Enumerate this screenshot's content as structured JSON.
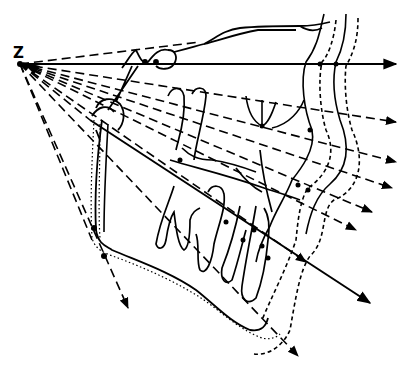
{
  "diagram": {
    "type": "cephalometric-tracing",
    "colors": {
      "ink": "#000000",
      "background": "#ffffff"
    },
    "origin_label": "Z",
    "origin_point": [
      20,
      64
    ],
    "rays": [
      {
        "id": "horizontal",
        "style": "solid",
        "end": [
          398,
          64
        ]
      },
      {
        "id": "r1",
        "style": "dashed",
        "end": [
          398,
          122
        ]
      },
      {
        "id": "r2",
        "style": "dashed",
        "end": [
          396,
          160
        ]
      },
      {
        "id": "r3",
        "style": "dashed",
        "end": [
          398,
          162
        ]
      },
      {
        "id": "r4",
        "style": "dashed",
        "end": [
          372,
          210
        ]
      },
      {
        "id": "r5",
        "style": "dashed",
        "end": [
          360,
          228
        ]
      },
      {
        "id": "main-axis",
        "style": "solid",
        "end": [
          372,
          303
        ]
      },
      {
        "id": "r6",
        "style": "dashed",
        "end": [
          310,
          262
        ]
      },
      {
        "id": "r7",
        "style": "dashed",
        "end": [
          300,
          357
        ]
      },
      {
        "id": "r8",
        "style": "dashed",
        "end": [
          128,
          308
        ]
      },
      {
        "id": "r9",
        "style": "dashed",
        "end": [
          98,
          232
        ]
      }
    ],
    "outlines": [
      {
        "id": "skull-base",
        "style": "solid"
      },
      {
        "id": "soft-tissue-profile-1",
        "style": "solid"
      },
      {
        "id": "soft-tissue-profile-2",
        "style": "dashed"
      },
      {
        "id": "soft-tissue-profile-3",
        "style": "solid"
      },
      {
        "id": "soft-tissue-profile-4",
        "style": "dashed"
      },
      {
        "id": "mandible",
        "style": "solid"
      },
      {
        "id": "mandible-alt",
        "style": "dotted"
      },
      {
        "id": "teeth",
        "style": "solid"
      }
    ]
  }
}
